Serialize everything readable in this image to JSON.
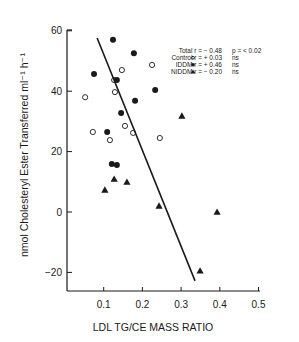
{
  "chart_data": {
    "type": "scatter",
    "title": "",
    "xlabel": "LDL TG/CE MASS RATIO",
    "ylabel": "nmol Cholesteryl Ester Transferred ml⁻¹ h⁻¹",
    "xlim": [
      0,
      0.5
    ],
    "ylim": [
      -27,
      60
    ],
    "x_ticks": [
      0.1,
      0.2,
      0.3,
      0.4,
      0.5
    ],
    "x_tick_labels": [
      "0.1",
      "0.2",
      "0.3",
      "0.4",
      "0.5"
    ],
    "y_ticks": [
      -20,
      0,
      20,
      40,
      60
    ],
    "y_tick_labels": [
      "-20",
      "0",
      "20",
      "40",
      "60"
    ],
    "grid": false,
    "legend_position": "top-right",
    "legend": [
      {
        "marker": "none",
        "label": "Total r = − 0.48",
        "stat": "p = < 0.02"
      },
      {
        "marker": "open-circle",
        "label": "Control r = + 0.03",
        "stat": "ns"
      },
      {
        "marker": "filled-circle",
        "label": "IDDM r = + 0.46",
        "stat": "ns"
      },
      {
        "marker": "filled-triangle",
        "label": "NIDDM r = − 0.20",
        "stat": "ns"
      }
    ],
    "series": [
      {
        "name": "Control",
        "marker": "open-circle",
        "points": [
          [
            0.147,
            47
          ],
          [
            0.225,
            48.7
          ],
          [
            0.127,
            43.7
          ],
          [
            0.129,
            39.7
          ],
          [
            0.052,
            38
          ],
          [
            0.155,
            28.5
          ],
          [
            0.072,
            26.5
          ],
          [
            0.116,
            23.8
          ],
          [
            0.176,
            26.2
          ],
          [
            0.245,
            24.5
          ]
        ]
      },
      {
        "name": "IDDM",
        "marker": "filled-circle",
        "points": [
          [
            0.124,
            57
          ],
          [
            0.178,
            52.6
          ],
          [
            0.075,
            45.7
          ],
          [
            0.134,
            43.7
          ],
          [
            0.233,
            40.4
          ],
          [
            0.181,
            36.8
          ],
          [
            0.145,
            32.8
          ],
          [
            0.109,
            26.5
          ],
          [
            0.121,
            15.9
          ],
          [
            0.134,
            15.6
          ]
        ]
      },
      {
        "name": "NIDDM",
        "marker": "filled-triangle",
        "points": [
          [
            0.127,
            10.9
          ],
          [
            0.16,
            9.9
          ],
          [
            0.103,
            7.3
          ],
          [
            0.243,
            2
          ],
          [
            0.302,
            31.8
          ],
          [
            0.393,
            0
          ],
          [
            0.349,
            -19.5
          ]
        ]
      }
    ],
    "regression_line": {
      "name": "Total",
      "from": [
        0.083,
        57.6
      ],
      "to": [
        0.336,
        -22.8
      ]
    }
  }
}
